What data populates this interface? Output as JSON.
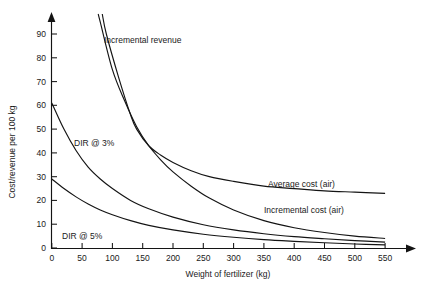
{
  "chart_data": {
    "type": "line",
    "title": "",
    "xlabel": "Weight of fertilizer (kg)",
    "ylabel": "Cost/revenue per 100 kg",
    "xlim": [
      0,
      600
    ],
    "ylim": [
      0,
      100
    ],
    "grid": false,
    "legend_position": "inline-annotations",
    "x_ticks": [
      "0",
      "50",
      "100",
      "150",
      "200",
      "250",
      "300",
      "350",
      "400",
      "450",
      "500",
      "550"
    ],
    "x_tick_values": [
      0,
      50,
      100,
      150,
      200,
      250,
      300,
      350,
      400,
      450,
      500,
      550
    ],
    "y_ticks": [
      "0",
      "10",
      "20",
      "30",
      "40",
      "50",
      "60",
      "70",
      "80",
      "90"
    ],
    "y_tick_values": [
      0,
      10,
      20,
      30,
      40,
      50,
      60,
      70,
      80,
      90
    ],
    "series": [
      {
        "name": "Incremental revenue",
        "label": "Incremental revenue",
        "label_x": 100,
        "label_y": 95,
        "x": [
          70,
          80,
          100,
          120,
          140,
          160,
          180,
          200,
          230,
          260,
          300,
          350,
          400,
          450,
          500,
          550,
          600
        ],
        "values": [
          105,
          95,
          75,
          62,
          51,
          43,
          37,
          32,
          26,
          21,
          16,
          11.5,
          8.5,
          6.5,
          5,
          4,
          3
        ]
      },
      {
        "name": "Average cost (air)",
        "label": "Average cost (air)",
        "label_x": 370,
        "label_y": 33,
        "x": [
          78,
          90,
          110,
          130,
          140,
          160,
          180,
          200,
          230,
          260,
          300,
          350,
          400,
          450,
          500,
          550,
          590
        ],
        "values": [
          105,
          90,
          72,
          56,
          50,
          43,
          39,
          36,
          32.5,
          30,
          28,
          26,
          25,
          24,
          23.5,
          23,
          22.7
        ]
      },
      {
        "name": "Incremental cost (air)",
        "label": "Incremental cost (air)",
        "label_x": 370,
        "label_y": 19,
        "x": [
          0,
          600
        ],
        "values": [
          15,
          15
        ]
      },
      {
        "name": "DIR @ 3%",
        "label": "DIR @ 3%",
        "label_x": 40,
        "label_y": 47,
        "x": [
          0,
          20,
          40,
          60,
          80,
          100,
          130,
          160,
          200,
          250,
          300,
          350,
          400,
          450,
          500,
          550,
          600
        ],
        "values": [
          61,
          50,
          41,
          34,
          29,
          25,
          20,
          16.5,
          13,
          9.8,
          7.6,
          6,
          4.8,
          3.9,
          3.1,
          2.5,
          2
        ]
      },
      {
        "name": "DIR @ 5%",
        "label": "DIR @ 5%",
        "label_x": 32,
        "label_y": 8,
        "x": [
          0,
          20,
          40,
          60,
          80,
          100,
          130,
          160,
          200,
          250,
          300,
          350,
          400,
          450,
          500,
          550,
          600
        ],
        "values": [
          29,
          25,
          21.5,
          18.5,
          16,
          14,
          11.5,
          9.5,
          7.6,
          5.8,
          4.5,
          3.5,
          2.8,
          2.2,
          1.7,
          1.3,
          1
        ]
      }
    ]
  },
  "axes": {
    "y_label": "Cost/revenue per 100 kg",
    "x_label": "Weight of fertilizer (kg)"
  },
  "labels": {
    "incremental_revenue": "Incremental revenue",
    "average_cost_air": "Average cost (air)",
    "incremental_cost_air": "Incremental cost (air)",
    "dir_3": "DIR @ 3%",
    "dir_5": "DIR @ 5%"
  },
  "x_tick_labels": {
    "t0": "0",
    "t1": "50",
    "t2": "100",
    "t3": "150",
    "t4": "200",
    "t5": "250",
    "t6": "300",
    "t7": "350",
    "t8": "400",
    "t9": "450",
    "t10": "500",
    "t11": "550"
  },
  "y_tick_labels": {
    "t0": "0",
    "t1": "10",
    "t2": "20",
    "t3": "30",
    "t4": "40",
    "t5": "50",
    "t6": "60",
    "t7": "70",
    "t8": "80",
    "t9": "90"
  },
  "colors": {
    "ink": "#141414",
    "background": "#ffffff"
  }
}
